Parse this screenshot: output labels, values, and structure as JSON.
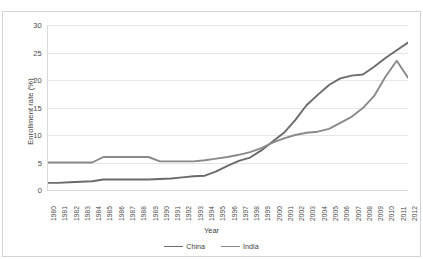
{
  "figure": {
    "title_fragment": "",
    "background": "#ffffff",
    "border_color": "#d4d4d4"
  },
  "axes": {
    "ylabel": "Enrollment rate (%)",
    "xlabel": "Year",
    "yticks": [
      "30",
      "25",
      "20",
      "15",
      "10",
      "5",
      "0"
    ]
  },
  "legend": {
    "items": [
      {
        "label": "China",
        "color": "#6b6b6b"
      },
      {
        "label": "India",
        "color": "#8a8a8a"
      }
    ]
  },
  "chart_data": {
    "type": "line",
    "title": "",
    "xlabel": "Year",
    "ylabel": "Enrollment rate (%)",
    "ylim": [
      0,
      30
    ],
    "ytick_step": 5,
    "grid": true,
    "legend_position": "bottom",
    "categories": [
      "1980",
      "1981",
      "1982",
      "1983",
      "1984",
      "1985",
      "1986",
      "1987",
      "1988",
      "1989",
      "1990",
      "1991",
      "1992",
      "1993",
      "1994",
      "1995",
      "1996",
      "1997",
      "1998",
      "1999",
      "2000",
      "2001",
      "2002",
      "2003",
      "2004",
      "2005",
      "2006",
      "2007",
      "2008",
      "2009",
      "2010",
      "2011",
      "2012"
    ],
    "series": [
      {
        "name": "China",
        "color": "#6b6b6b",
        "values": [
          1.3,
          1.3,
          1.4,
          1.5,
          1.6,
          1.9,
          1.9,
          1.9,
          1.9,
          1.9,
          2.0,
          2.1,
          2.3,
          2.5,
          2.6,
          3.4,
          4.4,
          5.3,
          5.9,
          7.2,
          8.8,
          10.4,
          12.7,
          15.4,
          17.3,
          19.1,
          20.3,
          20.8,
          21.0,
          22.4,
          24.0,
          25.4,
          26.8
        ]
      },
      {
        "name": "India",
        "color": "#8a8a8a",
        "values": [
          5.0,
          5.0,
          5.0,
          5.0,
          5.0,
          6.0,
          6.0,
          6.0,
          6.0,
          6.0,
          5.2,
          5.2,
          5.2,
          5.2,
          5.4,
          5.7,
          6.0,
          6.4,
          6.9,
          7.6,
          8.6,
          9.4,
          10.0,
          10.4,
          10.6,
          11.1,
          12.2,
          13.3,
          14.9,
          17.1,
          20.6,
          23.5,
          20.4
        ]
      }
    ]
  }
}
